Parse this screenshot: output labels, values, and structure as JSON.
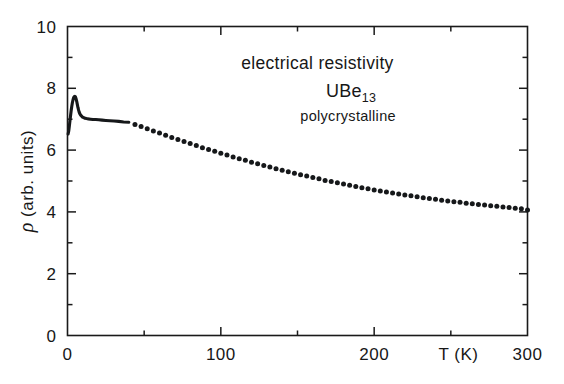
{
  "figure": {
    "background_color": "#ffffff",
    "ink_color": "#16181a"
  },
  "chart_data": {
    "type": "scatter",
    "title": "",
    "xlabel": "T (K)",
    "ylabel": "ρ (arb. units)",
    "xlim": [
      0,
      300
    ],
    "ylim": [
      0,
      10
    ],
    "grid": false,
    "legend": null,
    "x_ticks_major": [
      0,
      100,
      200,
      300
    ],
    "x_ticks_minor": [
      50,
      150,
      250
    ],
    "x_tick_labels": [
      "0",
      "100",
      "200",
      "300"
    ],
    "y_ticks_major": [
      0,
      2,
      4,
      6,
      8,
      10
    ],
    "y_ticks_minor": [
      1,
      3,
      5,
      7,
      9
    ],
    "y_tick_labels": [
      "0",
      "2",
      "4",
      "6",
      "8",
      "10"
    ],
    "series": [
      {
        "name": "UBe13 polycrystalline resistivity",
        "style": "dense-line-then-dots",
        "dense_segment_max_x": 40,
        "x": [
          0.4,
          0.8,
          1.2,
          1.6,
          2.0,
          2.4,
          2.8,
          3.2,
          3.6,
          4.0,
          4.4,
          4.8,
          5.2,
          5.6,
          6.0,
          6.4,
          6.8,
          7.2,
          7.6,
          8.0,
          8.6,
          9.2,
          9.8,
          10.6,
          11.4,
          12.4,
          13.6,
          15.0,
          16.6,
          18.4,
          20.4,
          22.6,
          25.0,
          27.6,
          30.4,
          33.4,
          36.6,
          40.0,
          44.0,
          48.0,
          52.0,
          56.0,
          60.0,
          64.0,
          68.0,
          72.0,
          76.0,
          80.0,
          84.0,
          88.0,
          92.0,
          96.0,
          100.0,
          104.0,
          108.0,
          112.0,
          116.0,
          120.0,
          124.0,
          128.0,
          132.0,
          136.0,
          140.0,
          144.0,
          148.0,
          152.0,
          156.0,
          160.0,
          164.0,
          168.0,
          172.0,
          176.0,
          180.0,
          184.0,
          188.0,
          192.0,
          196.0,
          200.0,
          204.0,
          208.0,
          212.0,
          216.0,
          220.0,
          224.0,
          228.0,
          232.0,
          236.0,
          240.0,
          244.0,
          248.0,
          252.0,
          256.0,
          260.0,
          264.0,
          268.0,
          272.0,
          276.0,
          280.0,
          284.0,
          288.0,
          292.0,
          296.0,
          300.0
        ],
        "y": [
          6.52,
          6.62,
          6.78,
          6.95,
          7.12,
          7.28,
          7.42,
          7.54,
          7.63,
          7.7,
          7.73,
          7.74,
          7.72,
          7.66,
          7.58,
          7.48,
          7.38,
          7.3,
          7.23,
          7.18,
          7.13,
          7.1,
          7.07,
          7.05,
          7.03,
          7.02,
          7.01,
          7.0,
          6.99,
          6.99,
          6.98,
          6.97,
          6.96,
          6.95,
          6.94,
          6.93,
          6.91,
          6.9,
          6.83,
          6.76,
          6.69,
          6.62,
          6.55,
          6.48,
          6.41,
          6.34,
          6.28,
          6.21,
          6.15,
          6.08,
          6.02,
          5.96,
          5.9,
          5.84,
          5.78,
          5.72,
          5.67,
          5.61,
          5.56,
          5.5,
          5.45,
          5.4,
          5.35,
          5.3,
          5.25,
          5.2,
          5.16,
          5.11,
          5.07,
          5.02,
          4.98,
          4.94,
          4.9,
          4.86,
          4.82,
          4.78,
          4.75,
          4.71,
          4.68,
          4.64,
          4.61,
          4.58,
          4.55,
          4.52,
          4.49,
          4.46,
          4.43,
          4.41,
          4.38,
          4.35,
          4.33,
          4.31,
          4.28,
          4.26,
          4.24,
          4.22,
          4.2,
          4.18,
          4.16,
          4.14,
          4.12,
          4.1,
          4.06
        ]
      }
    ],
    "annotations": [
      {
        "id": "title-line",
        "text": "electrical resistivity",
        "x": 163,
        "y": 8.62
      },
      {
        "id": "compound-line",
        "text": "UBe",
        "subscript": "13",
        "x": 185,
        "y": 7.72
      },
      {
        "id": "sample-line",
        "text": "polycrystalline",
        "x": 183,
        "y": 6.95
      }
    ]
  }
}
